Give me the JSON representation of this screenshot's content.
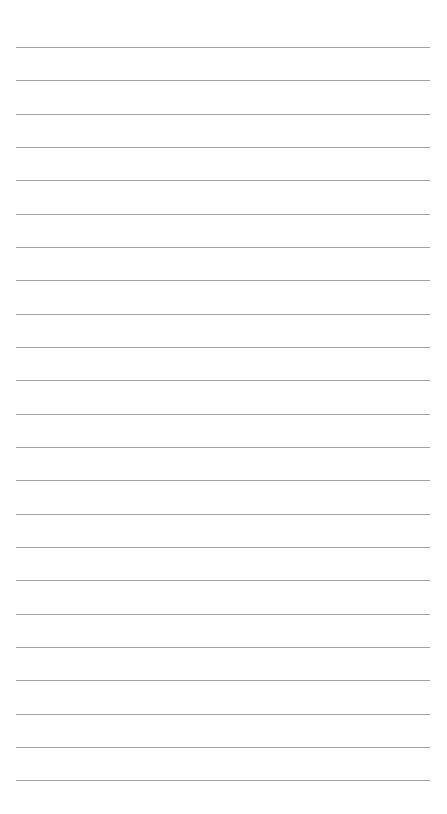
{
  "page": {
    "type": "lined-paper",
    "background_color": "#ffffff",
    "line_color": "#a3a3a3",
    "line_count": 23,
    "first_line_y": 47,
    "line_spacing": 33.33,
    "line_left": 16,
    "line_width": 414
  }
}
